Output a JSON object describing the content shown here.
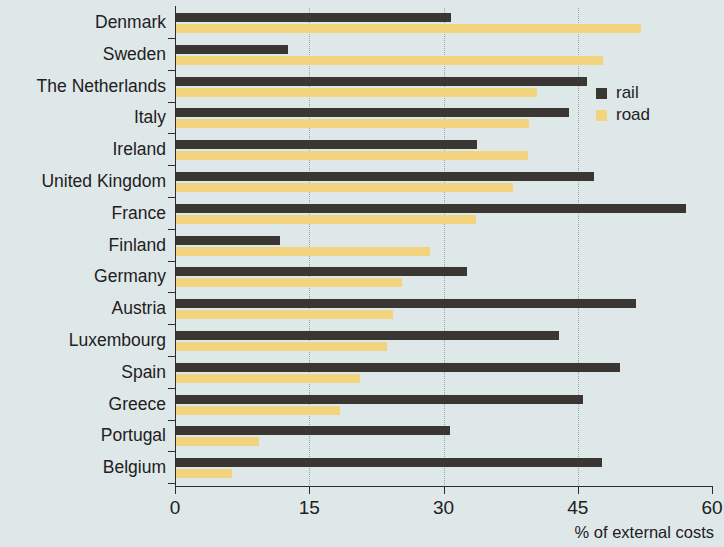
{
  "chart_data": {
    "type": "bar",
    "orientation": "horizontal",
    "title": "",
    "xlabel": "% of external costs",
    "ylabel": "",
    "xlim": [
      0,
      60
    ],
    "xticks": [
      0,
      15,
      30,
      45,
      60
    ],
    "xtick_labels": [
      "0",
      "15",
      "30",
      "45",
      "60"
    ],
    "grid": "vertical-dotted-at-15-30-45",
    "legend_position": "top-right-inside",
    "categories": [
      "Denmark",
      "Sweden",
      "The Netherlands",
      "Italy",
      "Ireland",
      "United Kingdom",
      "France",
      "Finland",
      "Germany",
      "Austria",
      "Luxembourg",
      "Spain",
      "Greece",
      "Portugal",
      "Belgium"
    ],
    "series": [
      {
        "name": "rail",
        "color": "#3a3733",
        "values": [
          30.8,
          12.6,
          46.0,
          44.0,
          33.7,
          46.8,
          57.1,
          11.7,
          32.6,
          51.5,
          42.9,
          49.7,
          45.6,
          30.7,
          47.7
        ]
      },
      {
        "name": "road",
        "color": "#f2d37e",
        "values": [
          52.1,
          47.8,
          40.5,
          39.6,
          39.4,
          37.8,
          33.6,
          28.5,
          25.4,
          24.4,
          23.7,
          20.7,
          18.4,
          9.4,
          6.4
        ]
      }
    ]
  },
  "legend": {
    "items": [
      {
        "label": "rail",
        "color": "#3a3733"
      },
      {
        "label": "road",
        "color": "#f2d37e"
      }
    ]
  },
  "colors": {
    "background": "#dfe8e8",
    "axis": "#2e2b28",
    "grid": "#9aa7a8",
    "rail": "#3a3733",
    "road": "#f2d37e",
    "text": "#22201e"
  }
}
